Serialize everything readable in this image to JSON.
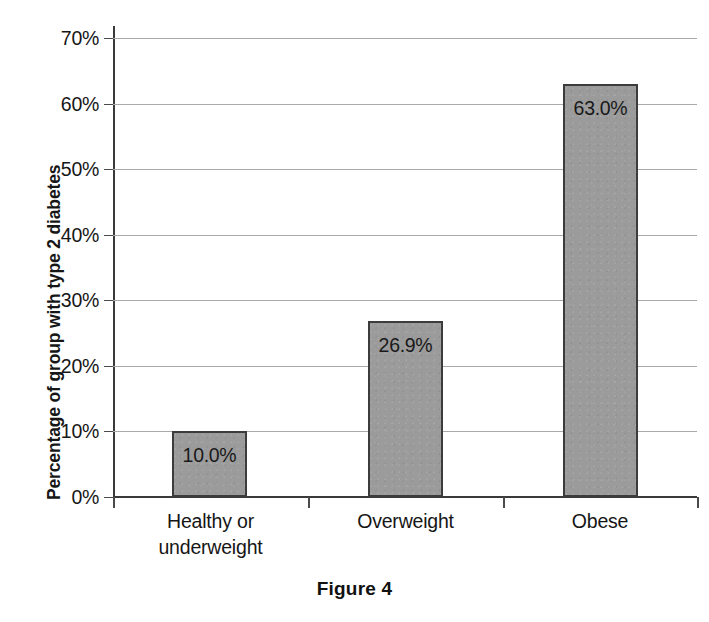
{
  "chart_data": {
    "type": "bar",
    "title": "",
    "categories": [
      "Healthy or underweight",
      "Overweight",
      "Obese"
    ],
    "category_lines": [
      [
        "Healthy or",
        "underweight"
      ],
      [
        "Overweight"
      ],
      [
        "Obese"
      ]
    ],
    "values": [
      10.0,
      26.9,
      63.0
    ],
    "data_labels": [
      "10.0%",
      "26.9%",
      "63.0%"
    ],
    "xlabel": "",
    "ylabel": "Percentage of group with type 2 diabetes",
    "ylim": [
      0,
      70
    ],
    "ytick_values": [
      0,
      10,
      20,
      30,
      40,
      50,
      60,
      70
    ],
    "ytick_labels": [
      "0%",
      "10%",
      "20%",
      "30%",
      "40%",
      "50%",
      "60%",
      "70%"
    ],
    "grid": true,
    "legend": "none",
    "bar_color": "#9b9b9b",
    "bar_border_color": "#3c3c3c",
    "gridline_color": "#a9a9a9",
    "axis_color": "#3a3a3a"
  },
  "caption": {
    "text": "Figure 4"
  },
  "artifacts": {
    "top_cutoff_text": "· · · · · ·"
  }
}
